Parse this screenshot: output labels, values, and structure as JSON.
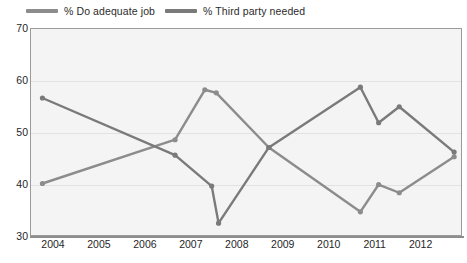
{
  "chart_data": {
    "type": "line",
    "title": "",
    "subtitle": "",
    "xlabel": "",
    "ylabel": "",
    "xlim": [
      2003.5,
      2012.9
    ],
    "ylim": [
      30,
      70
    ],
    "yticks": [
      30,
      40,
      50,
      60,
      70
    ],
    "xticks": [
      2004,
      2005,
      2006,
      2007,
      2008,
      2009,
      2010,
      2011,
      2012
    ],
    "grid": "horizontal",
    "legend_position": "top-left",
    "series": [
      {
        "name": "% Do adequate job",
        "color": "#8c8c8c",
        "points": [
          {
            "x": 2003.75,
            "y": 40.0
          },
          {
            "x": 2006.65,
            "y": 48.5
          },
          {
            "x": 2007.3,
            "y": 58.2
          },
          {
            "x": 2007.55,
            "y": 57.6
          },
          {
            "x": 2008.7,
            "y": 47.0
          },
          {
            "x": 2010.7,
            "y": 34.5
          },
          {
            "x": 2011.1,
            "y": 39.8
          },
          {
            "x": 2011.55,
            "y": 38.2
          },
          {
            "x": 2012.75,
            "y": 45.2
          }
        ]
      },
      {
        "name": "% Third party needed",
        "color": "#7a7a7a",
        "points": [
          {
            "x": 2003.75,
            "y": 56.6
          },
          {
            "x": 2006.65,
            "y": 45.5
          },
          {
            "x": 2007.45,
            "y": 39.5
          },
          {
            "x": 2007.6,
            "y": 32.3
          },
          {
            "x": 2008.7,
            "y": 47.0
          },
          {
            "x": 2010.7,
            "y": 58.7
          },
          {
            "x": 2011.1,
            "y": 51.8
          },
          {
            "x": 2011.55,
            "y": 54.9
          },
          {
            "x": 2012.75,
            "y": 46.1
          }
        ]
      }
    ]
  },
  "legend": {
    "entries": [
      {
        "label": "% Do adequate job",
        "swatch_name": "legend-swatch-do-adequate-job"
      },
      {
        "label": "% Third party needed",
        "swatch_name": "legend-swatch-third-party-needed"
      }
    ]
  },
  "colors": {
    "series_a": "#8c8c8c",
    "series_b": "#7a7a7a",
    "plot_background": "#f4f4f4",
    "plot_border": "#9a9a9a",
    "gridline": "#e2e2e2",
    "tick_text": "#1f1f1f"
  }
}
